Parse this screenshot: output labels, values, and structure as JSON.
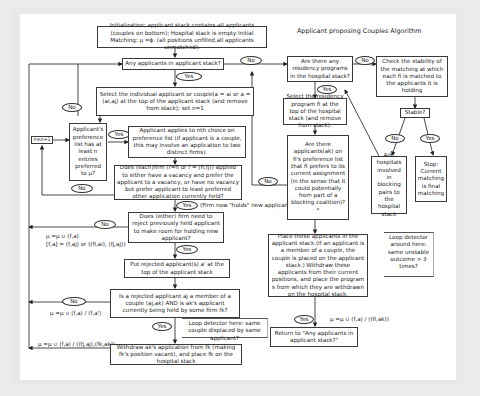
{
  "title": "Applicant proposing Couples Algorithm",
  "colors": {
    "background": "#ebebeb",
    "canvas": "#ffffff",
    "line": "#333333"
  },
  "nodes": {
    "init": "Initialization: applicant stack contains all applicants (couples on bottom); Hospital stack is empty Initial Matching: μ =ϕ. (all positions unfilled,all applicants unmatched).",
    "any_applicants": "Any applicants in applicant stack?",
    "select_applicant": "Select the individual applicant or couple(a = ai or a = (ai,aj) at the top of the applicant stack (and remove from stack); set n=1",
    "pref_list": "Applicant's preference list has at least n entries preferred to μ?",
    "n_increment": "n=n+1",
    "apply_nth": "Applicant applies to nth choice on preference list (if applicant is a couple, this may involve an application to two distinct firms).",
    "firm_check": "Does (each)firm (f=fi or f = (fi,fj)) applied to either have a vacancy and prefer the applicant to a vacancy, or have no vacancy but prefer applicant to least preferred other application currently held?",
    "firm_holds_note": "(Firm now \"holds\" new applicant.)",
    "reject_check": "Does (either) firm need to reject previously held applicant to make room for holding new applicant?",
    "put_rejected": "Put rejected applicant(s) a' at the top of the applicant stack",
    "couple_check": "Is a rejected applicant aj a member of a couple (aj,ak) AND is ak's applicant currently being held by some firm fk?",
    "loop_detector_couple": "Loop detector here: same couple displaced by same applicant?",
    "withdraw": "Withdraw ak's application from fk (making fk's position vacant), and place fk on the hospital stack",
    "residency_check": "Are there any residency programs in the hospital stack?",
    "check_stability": "Check the stability of the matching at which each fi is matched to the applicants it is holding",
    "stable_q": "Stable?",
    "select_program": "Select the residency program fi at the top of the hospital stack (and remove from stack).",
    "preferred_applicants": "Are there applicants(ak) on fi's preference list that fi prefers to its current assignment (in the sense that it could potentially from part of a blocking coalition)? *",
    "add_hospitals": "Add hospitals involved in blocking pairs to the hospital stack",
    "stop": "Stop: Current matching is final matching",
    "loop_detector_unstable": "Loop detector around here: same unstable outcome > 3 times?",
    "place_applicants": "Place these applicants in the applicant stack.(If an applicant is a member of a couple, the couple is placed on the applicant stack.) Withdraw these applicants from their current positions, and place the program s from which they are withdrawn on the hospital stack.",
    "return_to": "Return to \"Any applicants in applicant stack?\""
  },
  "labels": {
    "yes": "Yes",
    "no": "No"
  },
  "formulas": {
    "mu_update_1": "μ =μ ∪ (f,a)",
    "mu_update_2": "[f,a] = (f,aj) or ((fi,ai), (fj,aj))",
    "mu_update_3": "μ =μ ∪ (f,a) / (f,a')",
    "mu_update_4": "μ =μ ∪ (f,a) / ((fj,aj),(fk,ak))",
    "mu_update_5": "μ =μ ∪ (f,a) / ((fi,ak))"
  }
}
